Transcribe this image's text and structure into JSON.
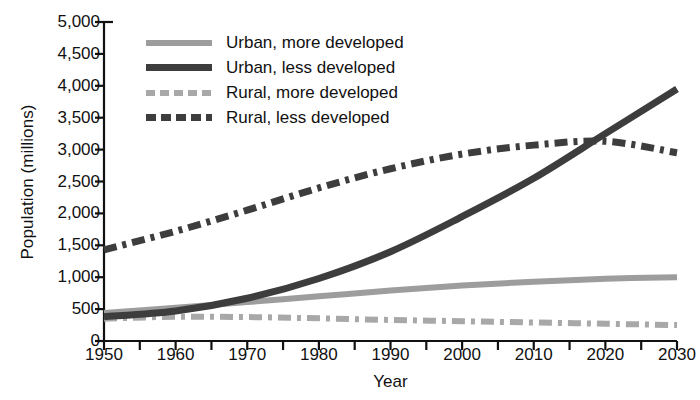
{
  "chart_data": {
    "type": "line",
    "title": "",
    "xlabel": "Year",
    "ylabel": "Population (millions)",
    "xlim": [
      1950,
      2030
    ],
    "ylim": [
      0,
      5000
    ],
    "grid": false,
    "legend_position": "top-left",
    "x": [
      1950,
      1960,
      1970,
      1980,
      1990,
      2000,
      2010,
      2020,
      2030
    ],
    "xticks": [
      "1950",
      "1960",
      "1970",
      "1980",
      "1990",
      "2000",
      "2010",
      "2020",
      "2030"
    ],
    "yticks": [
      "0",
      "500",
      "1,000",
      "1,500",
      "2,000",
      "2,500",
      "3,000",
      "3,500",
      "4,000",
      "4,500",
      "5,000"
    ],
    "ytick_values": [
      0,
      500,
      1000,
      1500,
      2000,
      2500,
      3000,
      3500,
      4000,
      4500,
      5000
    ],
    "series": [
      {
        "name": "Urban, more developed",
        "style": "solid",
        "color": "#9d9d9d",
        "width": 6,
        "values": [
          440,
          520,
          610,
          700,
          790,
          870,
          930,
          975,
          1000
        ]
      },
      {
        "name": "Urban, less developed",
        "style": "solid",
        "color": "#3d3d3d",
        "width": 7,
        "values": [
          380,
          470,
          670,
          980,
          1400,
          1950,
          2550,
          3250,
          3950
        ]
      },
      {
        "name": "Rural, more developed",
        "style": "dash-dot",
        "color": "#a8a8a8",
        "width": 6,
        "values": [
          350,
          380,
          375,
          355,
          330,
          310,
          290,
          270,
          250
        ]
      },
      {
        "name": "Rural, less developed",
        "style": "dash-dot",
        "color": "#3d3d3d",
        "width": 7,
        "values": [
          1430,
          1720,
          2050,
          2400,
          2700,
          2930,
          3070,
          3130,
          2950
        ]
      }
    ],
    "annotations": []
  },
  "legend": {
    "items": [
      {
        "label": "Urban, more developed",
        "swatch": "solid-light"
      },
      {
        "label": "Urban, less developed",
        "swatch": "solid-dark"
      },
      {
        "label": "Rural, more developed",
        "swatch": "dash-light"
      },
      {
        "label": "Rural, less developed",
        "swatch": "dash-dark"
      }
    ]
  },
  "colors": {
    "light_gray": "#9d9d9d",
    "dark_gray": "#3d3d3d",
    "axis": "#111111",
    "background": "#ffffff"
  }
}
